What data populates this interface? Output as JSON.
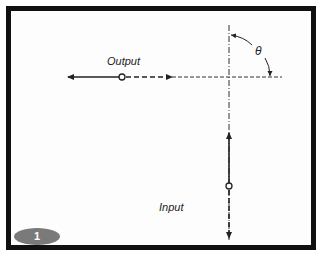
{
  "diagram": {
    "labels": {
      "output": "Output",
      "input": "Input",
      "angle": "θ"
    },
    "badge": {
      "number": "1"
    },
    "colors": {
      "frame": "#111111",
      "lines": "#222222",
      "badge": "#7a7a7a",
      "background": "#fdfdfd"
    }
  }
}
